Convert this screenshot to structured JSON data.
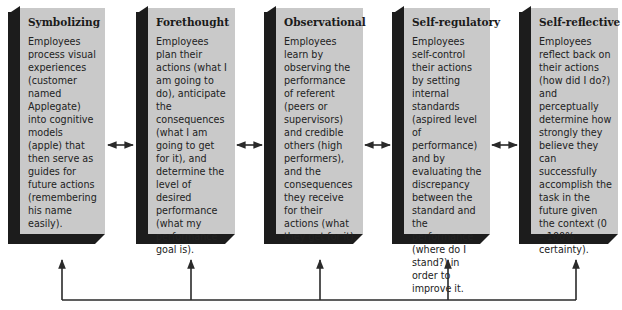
{
  "diagram": {
    "boxes": [
      {
        "title": "Symbolizing",
        "text": "Employees process visual experiences (customer named Applegate) into cognitive models (apple) that then serve as guides for future actions (remembering his name easily)."
      },
      {
        "title": "Forethought",
        "text": "Employees plan their actions (what I am going to do), anticipate the consequences (what I am going to get for it), and determine the level of desired performance (what my performance goal is)."
      },
      {
        "title": "Observational",
        "text": "Employees learn by observing the performance of referent (peers or supervisors) and credible others (high performers), and the consequences they receive for their actions (what they get for it)."
      },
      {
        "title": "Self-regulatory",
        "text": "Employees self-control their actions by setting internal standards (aspired level of performance) and by evaluating the discrepancy between the standard and the performance (where do I stand?) in order to improve it."
      },
      {
        "title": "Self-reflective",
        "text": "Employees reflect back on their actions (how did I do?) and perceptually determine how strongly they believe they can successfully accomplish the task in the future given the context (0 – 100% certainty)."
      }
    ],
    "connector_icons": {
      "between_boxes": "double-headed-arrow-icon",
      "feedback": "up-arrow-icon"
    },
    "colors": {
      "face": "#c9c9c9",
      "shadow": "#1c1c1c",
      "arrow": "#2a2a2a"
    }
  }
}
